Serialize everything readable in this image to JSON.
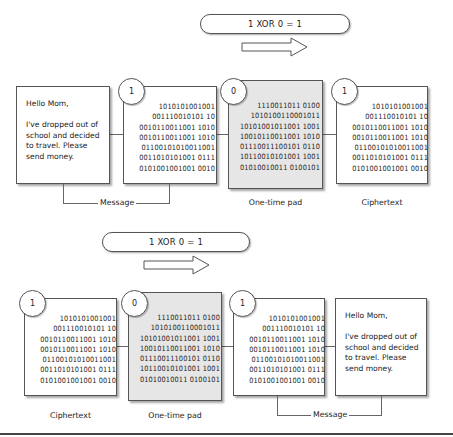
{
  "encrypt": {
    "formula": "1 XOR 0 = 1",
    "letter": {
      "greeting": "Hello Mom,",
      "body": "I've dropped out of\nschool and decided\nto travel. Please\nsend money."
    },
    "message_bits": {
      "bit": "1",
      "rows": [
        "1010101001001",
        "001110010101 10",
        "0010110011001 1010",
        "0010110011001 1010",
        "01100101010011001",
        "0011010101001 0111",
        "0101001001001 0010"
      ]
    },
    "pad_bits": {
      "bit": "0",
      "rows": [
        "1110011011 0100",
        "1010100110001011",
        "10101001011001 1001",
        "10010110011001 1010",
        "01110011100101 0110",
        "10110010101001 1001",
        "01010010011 0100101"
      ]
    },
    "cipher_bits": {
      "bit": "1",
      "rows": [
        "1010101001001",
        "001110010101 10",
        "0010110011001 1010",
        "0010110011001 1010",
        "01100101010011001",
        "0011010101001 0111",
        "0101001001001 0010"
      ]
    },
    "labels": {
      "message": "Message",
      "pad": "One-time pad",
      "ciphertext": "Ciphertext"
    }
  },
  "decrypt": {
    "formula": "1 XOR 0 = 1",
    "cipher_bits": {
      "bit": "1",
      "rows": [
        "1010101001001",
        "001110010101 10",
        "0010110011001 1010",
        "0010110011001 1010",
        "01100101010011001",
        "0011010101001 0111",
        "0101001001001 0010"
      ]
    },
    "pad_bits": {
      "bit": "0",
      "rows": [
        "1110011011 0100",
        "1010100110001011",
        "10101001011001 1001",
        "10010110011001 1010",
        "01110011100101 0110",
        "10110010101001 1001",
        "01010010011 0100101"
      ]
    },
    "message_bits": {
      "bit": "1",
      "rows": [
        "1010101001001",
        "001110010101 10",
        "0010110011001 1010",
        "0010110011001 1010",
        "01100101010011001",
        "0011010101001 0111",
        "0101001001001 0010"
      ]
    },
    "letter": {
      "greeting": "Hello Mom,",
      "body": "I've dropped out of\nschool and decided\nto travel. Please\nsend money."
    },
    "labels": {
      "ciphertext": "Ciphertext",
      "pad": "One-time pad",
      "message": "Message"
    }
  }
}
